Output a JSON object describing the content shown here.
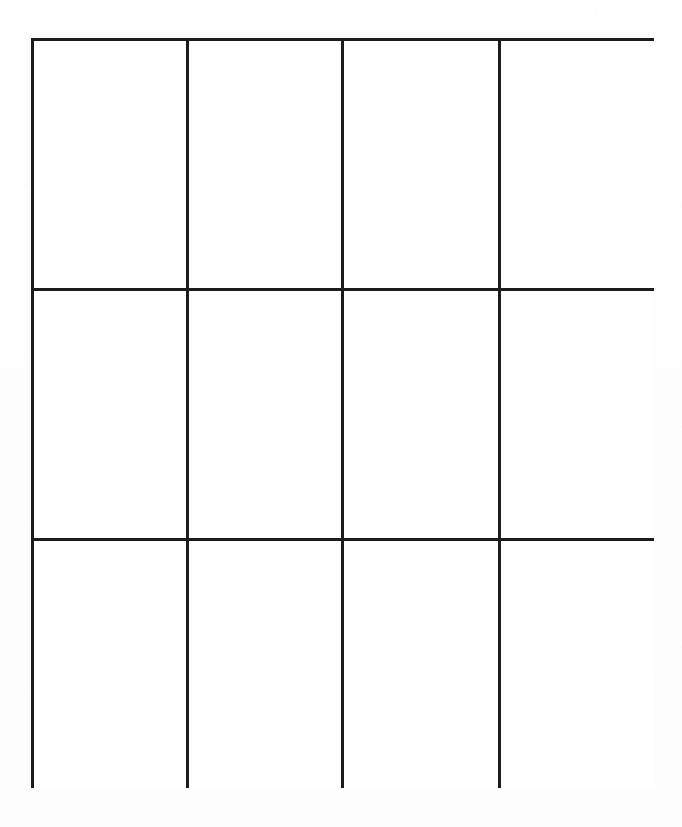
{
  "page": {
    "kind": "blank-grid-worksheet",
    "background_color": "#fefefe",
    "width": 682,
    "height": 827
  },
  "grid": {
    "columns": 4,
    "rows": 3,
    "total_cells": 12,
    "line_color": "#1c1c1c",
    "line_width_px": 3,
    "cell_background": "#ffffff",
    "bounds": {
      "left": 31,
      "top": 38,
      "right": 654,
      "bottom": 788,
      "width": 623,
      "height": 750
    },
    "vertical_divider_x": [
      186,
      340,
      496
    ],
    "horizontal_divider_y": [
      288,
      538
    ],
    "cells": [
      {
        "row": 1,
        "column": 1,
        "text": ""
      },
      {
        "row": 1,
        "column": 2,
        "text": ""
      },
      {
        "row": 1,
        "column": 3,
        "text": ""
      },
      {
        "row": 1,
        "column": 4,
        "text": ""
      },
      {
        "row": 2,
        "column": 1,
        "text": ""
      },
      {
        "row": 2,
        "column": 2,
        "text": ""
      },
      {
        "row": 2,
        "column": 3,
        "text": ""
      },
      {
        "row": 2,
        "column": 4,
        "text": ""
      },
      {
        "row": 3,
        "column": 1,
        "text": ""
      },
      {
        "row": 3,
        "column": 2,
        "text": ""
      },
      {
        "row": 3,
        "column": 3,
        "text": ""
      },
      {
        "row": 3,
        "column": 4,
        "text": ""
      }
    ]
  }
}
